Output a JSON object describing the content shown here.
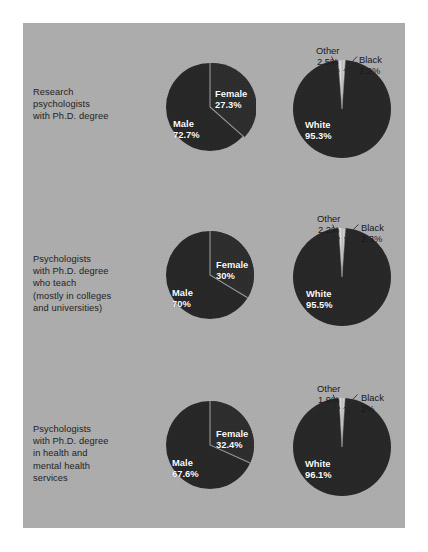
{
  "figure": {
    "background_color": "#adadad",
    "page_color": "#ffffff",
    "pie_dark_color": "#252525",
    "pie_sliver_color": "#d9d9d9",
    "label_color": "#ffffff"
  },
  "chart_data": [
    {
      "type": "pie",
      "title": "Research psychologists with Ph.D. degree — gender",
      "row": 1,
      "group": "gender",
      "categories": [
        "Male",
        "Female"
      ],
      "values": [
        72.7,
        27.3
      ],
      "labels": [
        "Male\n72.7%",
        "Female\n27.3%"
      ]
    },
    {
      "type": "pie",
      "title": "Research psychologists with Ph.D. degree — race",
      "row": 1,
      "group": "race",
      "categories": [
        "White",
        "Other",
        "Black"
      ],
      "values": [
        95.3,
        2.5,
        2.2
      ],
      "labels": [
        "White\n95.3%",
        "Other\n2.5%",
        "Black\n2.2%"
      ]
    },
    {
      "type": "pie",
      "title": "Psychologists with Ph.D. degree who teach — gender",
      "row": 2,
      "group": "gender",
      "categories": [
        "Male",
        "Female"
      ],
      "values": [
        70,
        30
      ],
      "labels": [
        "Male\n70%",
        "Female\n30%"
      ]
    },
    {
      "type": "pie",
      "title": "Psychologists with Ph.D. degree who teach — race",
      "row": 2,
      "group": "race",
      "categories": [
        "White",
        "Other",
        "Black"
      ],
      "values": [
        95.5,
        2.2,
        2.3
      ],
      "labels": [
        "White\n95.5%",
        "Other\n2.2%",
        "Black\n2.3%"
      ]
    },
    {
      "type": "pie",
      "title": "Psychologists with Ph.D. degree in health and mental health services — gender",
      "row": 3,
      "group": "gender",
      "categories": [
        "Male",
        "Female"
      ],
      "values": [
        67.6,
        32.4
      ],
      "labels": [
        "Male\n67.6%",
        "Female\n32.4%"
      ]
    },
    {
      "type": "pie",
      "title": "Psychologists with Ph.D. degree in health and mental health services — race",
      "row": 3,
      "group": "race",
      "categories": [
        "White",
        "Other",
        "Black"
      ],
      "values": [
        96.1,
        1.9,
        2.0
      ],
      "labels": [
        "White\n96.1%",
        "Other\n1.9%",
        "Black\n2%"
      ]
    }
  ],
  "rows": [
    {
      "caption": "Research\npsychologists\nwith Ph.D. degree",
      "gender": {
        "male_name": "Male",
        "male_value": "72.7%",
        "female_name": "Female",
        "female_value": "27.3%"
      },
      "race": {
        "white_name": "White",
        "white_value": "95.3%",
        "other_name": "Other",
        "other_value": "2.5%",
        "black_name": "Black",
        "black_value": "2.2%"
      }
    },
    {
      "caption": "Psychologists\nwith Ph.D. degree\nwho teach\n(mostly in colleges\nand universities)",
      "gender": {
        "male_name": "Male",
        "male_value": "70%",
        "female_name": "Female",
        "female_value": "30%"
      },
      "race": {
        "white_name": "White",
        "white_value": "95.5%",
        "other_name": "Other",
        "other_value": "2.2%",
        "black_name": "Black",
        "black_value": "2.3%"
      }
    },
    {
      "caption": "Psychologists\nwith Ph.D. degree\nin health and\nmental health\nservices",
      "gender": {
        "male_name": "Male",
        "male_value": "67.6%",
        "female_name": "Female",
        "female_value": "32.4%"
      },
      "race": {
        "white_name": "White",
        "white_value": "96.1%",
        "other_name": "Other",
        "other_value": "1.9%",
        "black_name": "Black",
        "black_value": "2%"
      }
    }
  ]
}
